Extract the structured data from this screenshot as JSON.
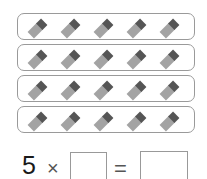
{
  "figure": {
    "groups_count": 4,
    "items_per_group": 5,
    "item_icon": "chocolate-bar-icon",
    "colors": {
      "border": "#9a9a9a",
      "bar_body": "#a3a3a3",
      "bar_cap": "#555555"
    }
  },
  "equation": {
    "factor": "5",
    "times": "×",
    "equals": "=",
    "blank1": "",
    "blank2": ""
  }
}
